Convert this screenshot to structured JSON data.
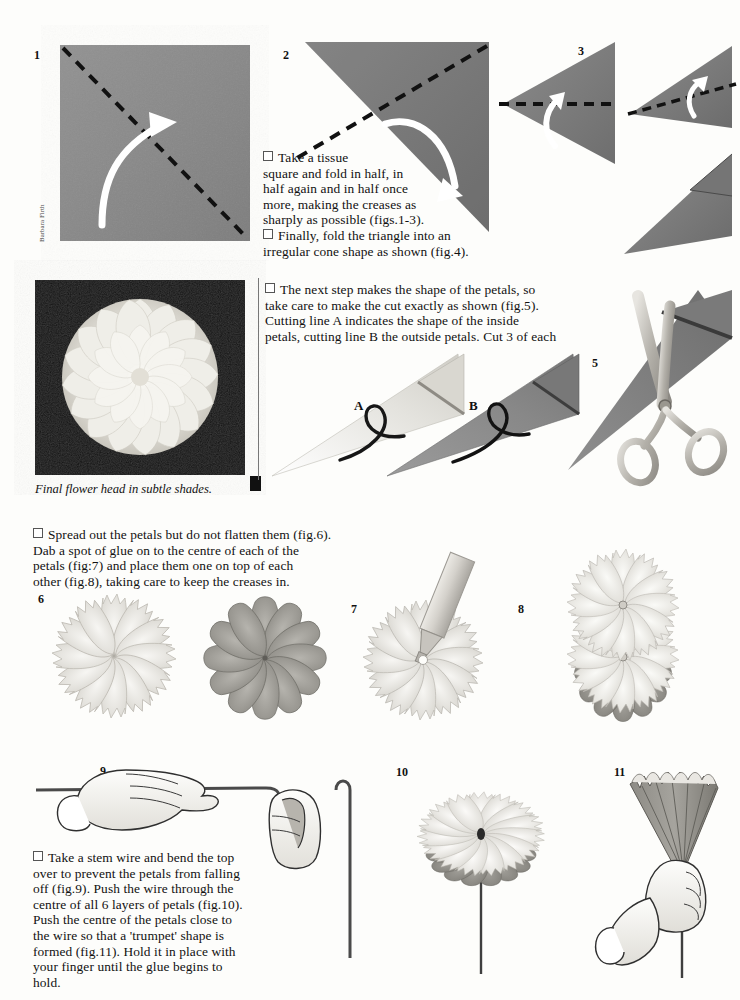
{
  "document": {
    "title": "Tissue paper flower - step by step instructions",
    "credit": "Barbara Firth"
  },
  "figures": [
    {
      "id": "1",
      "label": "1",
      "caption": "Grey tissue square with diagonal dashed fold line and curved fold arrow"
    },
    {
      "id": "2",
      "label": "2",
      "caption": "Folded triangle with dashed fold line and curved fold arrow"
    },
    {
      "id": "3",
      "label": "3",
      "caption": "Triangle folded again with horizontal dashed line and arrow"
    },
    {
      "id": "4",
      "label": "",
      "caption": "Irregular cone shape"
    },
    {
      "id": "5",
      "label": "5",
      "caption": "Scissors cutting the folded cone"
    },
    {
      "id": "6",
      "label": "6",
      "caption": "Two spread petal rosettes, light notched petals and dark rounded petals"
    },
    {
      "id": "7",
      "label": "7",
      "caption": "Glue tube dabbing glue on to the centre of a petal rosette"
    },
    {
      "id": "8",
      "label": "8",
      "caption": "Petal rosettes stacked one on top of each other"
    },
    {
      "id": "9",
      "label": "9",
      "caption": "Two hands bending the top of a stem wire over"
    },
    {
      "id": "10",
      "label": "10",
      "caption": "Finished flower head threaded on to the wire stem"
    },
    {
      "id": "11",
      "label": "11",
      "caption": "Hand squeezing the petals into a trumpet shape"
    }
  ],
  "cut_labels": {
    "a": "A",
    "b": "B"
  },
  "photo": {
    "caption": "Final flower head in subtle shades."
  },
  "text_blocks": {
    "fold": {
      "lines": [
        "Take a tissue",
        "square and fold in half, in",
        "half again and in half once",
        "more, making the creases as",
        "sharply as possible (figs.1-3).",
        "Finally, fold the triangle into an",
        "irregular cone shape as shown (fig.4)."
      ]
    },
    "cut": {
      "lines": [
        "The next step makes the shape of the petals, so",
        "take care to make the cut exactly as shown (fig.5).",
        "Cutting line A indicates the shape of the inside",
        "petals, cutting line B the outside petals. Cut 3 of each"
      ]
    },
    "spread": {
      "lines": [
        "Spread out the petals but do not flatten them (fig.6).",
        "Dab a spot of glue on to the centre of each of the",
        "petals (fig:7) and place them one on top of each",
        "other (fig.8), taking care to keep the creases in."
      ]
    },
    "stem": {
      "lines": [
        "Take a stem wire and bend the top",
        "over to prevent the petals from falling",
        "off (fig.9). Push the wire through the",
        "centre of all 6 layers of petals (fig.10).",
        "Push the centre of the petals close to",
        "the wire so that a 'trumpet' shape is",
        "formed (fig.11). Hold it in place with",
        "your finger until the glue begins to",
        "hold."
      ]
    }
  },
  "colors": {
    "paper_grey": "#8a8a8a",
    "paper_grey_dark": "#6f6f6f",
    "petal_light": "#e8e6e2",
    "petal_dark": "#9d9d9d",
    "ink": "#111111",
    "photo_bg": "#0b0b0b"
  }
}
